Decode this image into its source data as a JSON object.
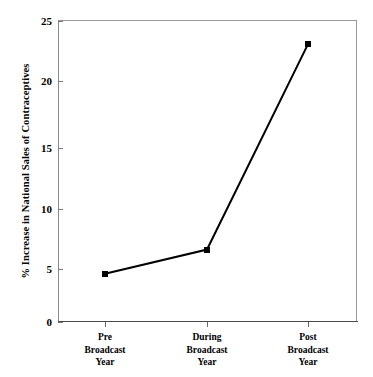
{
  "chart_data": {
    "type": "line",
    "title": "",
    "xlabel": "",
    "ylabel": "% Increase in National Sales of Contraceptives",
    "categories": [
      "Pre Broadcast Year",
      "During Broadcast Year",
      "Post Broadcast Year"
    ],
    "category_lines": [
      [
        "Pre",
        "Broadcast",
        "Year"
      ],
      [
        "During",
        "Broadcast",
        "Year"
      ],
      [
        "Post",
        "Broadcast",
        "Year"
      ]
    ],
    "values": [
      4,
      6,
      23
    ],
    "ylim": [
      0,
      25
    ],
    "yticks": [
      0,
      5,
      10,
      15,
      20,
      25
    ],
    "ytick_labels": [
      "0",
      "5",
      "10",
      "15",
      "20",
      "25"
    ],
    "grid": false,
    "legend": "none",
    "series": [
      {
        "name": "% Increase in National Sales of Contraceptives",
        "values": [
          4,
          6,
          23
        ],
        "marker": "square",
        "marker_color": "#000000",
        "line_color": "#000000"
      }
    ],
    "colors": {
      "line": "#000000",
      "marker": "#000000",
      "axis": "#4a4a4a",
      "frame": "#9a9a9a",
      "text": "#000000",
      "background": "#ffffff"
    }
  }
}
